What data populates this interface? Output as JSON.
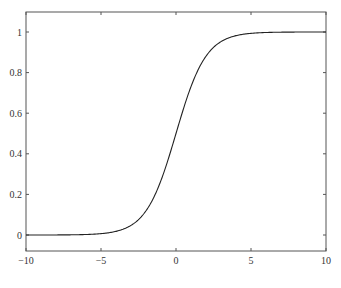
{
  "chart_data": {
    "type": "line",
    "title": "",
    "xlabel": "",
    "ylabel": "",
    "xlim": [
      -10,
      10
    ],
    "ylim": [
      -0.08,
      1.1
    ],
    "grid": false,
    "legend": null,
    "x_ticks": [
      -10,
      -5,
      0,
      5,
      10
    ],
    "x_tick_labels": [
      "−10",
      "−5",
      "0",
      "5",
      "10"
    ],
    "y_ticks": [
      0,
      0.2,
      0.4,
      0.6,
      0.8,
      1
    ],
    "y_tick_labels": [
      "0",
      "0.2",
      "0.4",
      "0.6",
      "0.8",
      "1"
    ],
    "series": [
      {
        "name": "sigmoid",
        "function": "1/(1+exp(-x))",
        "color": "#222222",
        "x": [
          -10,
          -8,
          -6,
          -5,
          -4,
          -3,
          -2,
          -1,
          0,
          1,
          2,
          3,
          4,
          5,
          6,
          8,
          10
        ],
        "y": [
          5e-05,
          0.0003,
          0.0025,
          0.0067,
          0.018,
          0.047,
          0.119,
          0.269,
          0.5,
          0.731,
          0.881,
          0.953,
          0.982,
          0.9933,
          0.9975,
          0.9997,
          0.99995
        ]
      }
    ],
    "caption_truncated": true
  }
}
